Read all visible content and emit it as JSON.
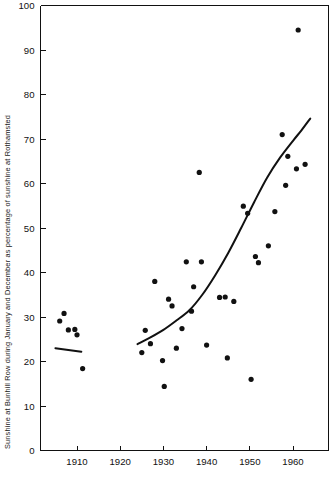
{
  "chart_data": {
    "type": "scatter",
    "title": "",
    "subtitle": "",
    "xlabel": "",
    "ylabel": "Sunshine at Bunhill Row during January and December as percentage of sunshine at Rothamsted",
    "xlim": [
      1903,
      1965
    ],
    "ylim": [
      0,
      100
    ],
    "grid": false,
    "legend": "none",
    "xticks": [
      1910,
      1920,
      1930,
      1940,
      1950,
      1960
    ],
    "xtick_labels": [
      "1910",
      "1920",
      "1930",
      "1940",
      "1950",
      "1960"
    ],
    "yticks": [
      0,
      10,
      20,
      30,
      40,
      50,
      60,
      70,
      80,
      90,
      100
    ],
    "ytick_labels": [
      "0",
      "10",
      "20",
      "30",
      "40",
      "50",
      "60",
      "70",
      "80",
      "90",
      "100"
    ],
    "marker": "filled-circle",
    "marker_color": "#111111",
    "points": [
      {
        "x": 1906.0,
        "y": 29.1
      },
      {
        "x": 1907.0,
        "y": 30.8
      },
      {
        "x": 1908.0,
        "y": 27.1
      },
      {
        "x": 1909.5,
        "y": 27.2
      },
      {
        "x": 1910.0,
        "y": 26.0
      },
      {
        "x": 1911.3,
        "y": 18.4
      },
      {
        "x": 1925.0,
        "y": 22.0
      },
      {
        "x": 1925.8,
        "y": 27.0
      },
      {
        "x": 1927.0,
        "y": 24.0
      },
      {
        "x": 1928.0,
        "y": 38.0
      },
      {
        "x": 1929.8,
        "y": 20.2
      },
      {
        "x": 1930.2,
        "y": 14.4
      },
      {
        "x": 1931.2,
        "y": 34.0
      },
      {
        "x": 1932.0,
        "y": 32.5
      },
      {
        "x": 1933.0,
        "y": 23.0
      },
      {
        "x": 1934.3,
        "y": 27.4
      },
      {
        "x": 1935.3,
        "y": 42.4
      },
      {
        "x": 1936.5,
        "y": 31.3
      },
      {
        "x": 1937.0,
        "y": 36.8
      },
      {
        "x": 1938.3,
        "y": 62.5
      },
      {
        "x": 1938.8,
        "y": 42.4
      },
      {
        "x": 1940.0,
        "y": 23.7
      },
      {
        "x": 1943.0,
        "y": 34.4
      },
      {
        "x": 1944.3,
        "y": 34.5
      },
      {
        "x": 1944.8,
        "y": 20.8
      },
      {
        "x": 1946.3,
        "y": 33.5
      },
      {
        "x": 1948.5,
        "y": 54.9
      },
      {
        "x": 1949.5,
        "y": 53.3
      },
      {
        "x": 1950.3,
        "y": 16.0
      },
      {
        "x": 1951.3,
        "y": 43.6
      },
      {
        "x": 1952.0,
        "y": 42.2
      },
      {
        "x": 1954.3,
        "y": 46.0
      },
      {
        "x": 1955.8,
        "y": 53.7
      },
      {
        "x": 1957.5,
        "y": 71.0
      },
      {
        "x": 1958.3,
        "y": 59.6
      },
      {
        "x": 1958.8,
        "y": 66.1
      },
      {
        "x": 1960.8,
        "y": 63.3
      },
      {
        "x": 1961.2,
        "y": 94.5
      },
      {
        "x": 1962.8,
        "y": 64.3
      }
    ],
    "fitted_curves": [
      {
        "name": "early-period-trend",
        "style": "straight-line",
        "points": [
          {
            "x": 1905.0,
            "y": 23.0
          },
          {
            "x": 1911.0,
            "y": 22.2
          }
        ]
      },
      {
        "name": "main-period-exponential-trend",
        "style": "smooth-curve",
        "points": [
          {
            "x": 1924.0,
            "y": 23.9
          },
          {
            "x": 1927.0,
            "y": 25.4
          },
          {
            "x": 1930.0,
            "y": 27.1
          },
          {
            "x": 1933.0,
            "y": 29.2
          },
          {
            "x": 1936.0,
            "y": 31.5
          },
          {
            "x": 1939.0,
            "y": 35.0
          },
          {
            "x": 1942.0,
            "y": 39.4
          },
          {
            "x": 1945.0,
            "y": 44.4
          },
          {
            "x": 1948.0,
            "y": 50.0
          },
          {
            "x": 1951.0,
            "y": 55.8
          },
          {
            "x": 1954.0,
            "y": 61.3
          },
          {
            "x": 1957.0,
            "y": 65.8
          },
          {
            "x": 1960.0,
            "y": 69.6
          },
          {
            "x": 1962.0,
            "y": 72.0
          },
          {
            "x": 1964.0,
            "y": 74.6
          }
        ]
      }
    ]
  },
  "axes": {
    "y_axis_label": "Sunshine at Bunhill Row during January and December as percentage of sunshine at Rothamsted"
  }
}
